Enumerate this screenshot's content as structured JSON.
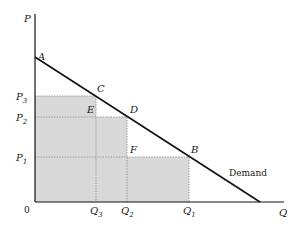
{
  "diagram": {
    "type": "demand-curve",
    "axes": {
      "y_label": "P",
      "x_label": "Q",
      "origin_label": "0"
    },
    "curve_label": "Demand",
    "price_levels": [
      {
        "label": "P",
        "sub": "3"
      },
      {
        "label": "P",
        "sub": "2"
      },
      {
        "label": "P",
        "sub": "1"
      }
    ],
    "quantity_levels": [
      {
        "label": "Q",
        "sub": "3"
      },
      {
        "label": "Q",
        "sub": "2"
      },
      {
        "label": "Q",
        "sub": "1"
      }
    ],
    "points": {
      "A": "A",
      "B": "B",
      "C": "C",
      "D": "D",
      "E": "E",
      "F": "F"
    },
    "colors": {
      "shade": "#d9d9d9",
      "line": "#111111",
      "dotted": "#8a8a8a"
    }
  }
}
